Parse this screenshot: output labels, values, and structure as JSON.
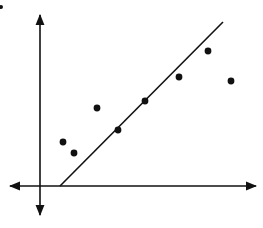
{
  "chart_data": {
    "type": "scatter",
    "title": "",
    "xlabel": "",
    "ylabel": "",
    "grid": false,
    "legend": null,
    "axes": {
      "style": "double-arrow",
      "origin_px": [
        40,
        186
      ],
      "x_arrow_left_px": [
        10,
        186
      ],
      "x_arrow_right_px": [
        256,
        186
      ],
      "y_arrow_top_px": [
        40,
        15
      ],
      "y_arrow_bottom_px": [
        40,
        215
      ]
    },
    "points_px": [
      {
        "x": 63,
        "y": 142
      },
      {
        "x": 74,
        "y": 153
      },
      {
        "x": 97,
        "y": 108
      },
      {
        "x": 118,
        "y": 130
      },
      {
        "x": 145,
        "y": 101
      },
      {
        "x": 179,
        "y": 77
      },
      {
        "x": 208,
        "y": 51
      },
      {
        "x": 231,
        "y": 81
      }
    ],
    "points_relative": [
      {
        "x": 23,
        "y": 44
      },
      {
        "x": 34,
        "y": 33
      },
      {
        "x": 57,
        "y": 78
      },
      {
        "x": 78,
        "y": 56
      },
      {
        "x": 105,
        "y": 85
      },
      {
        "x": 139,
        "y": 109
      },
      {
        "x": 168,
        "y": 135
      },
      {
        "x": 191,
        "y": 105
      }
    ],
    "trend_line": {
      "label": "line of fit",
      "start_px": [
        60,
        186
      ],
      "end_px": [
        223,
        22
      ]
    },
    "colors": {
      "ink": "#111111",
      "background": "#ffffff"
    }
  },
  "marker": {
    "corner_dot_px": [
      1,
      7
    ]
  }
}
